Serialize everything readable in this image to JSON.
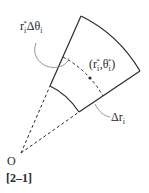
{
  "diagram": {
    "labels": {
      "arc_length": {
        "base": "r",
        "sub": "i",
        "sup": "*",
        "delta": "Δθ",
        "delta_sub": "i"
      },
      "point": {
        "open": "(r",
        "sub1": "i",
        "sup1": "*",
        "mid": ",θ",
        "sub2": "i",
        "sup2": "*",
        "close": ")"
      },
      "radial": {
        "delta": "Δr",
        "sub": "i"
      },
      "origin": "O",
      "figure_number": "[2–1]"
    },
    "colors": {
      "stroke": "#2a2a2a",
      "callout": "#8a8a8a"
    }
  }
}
